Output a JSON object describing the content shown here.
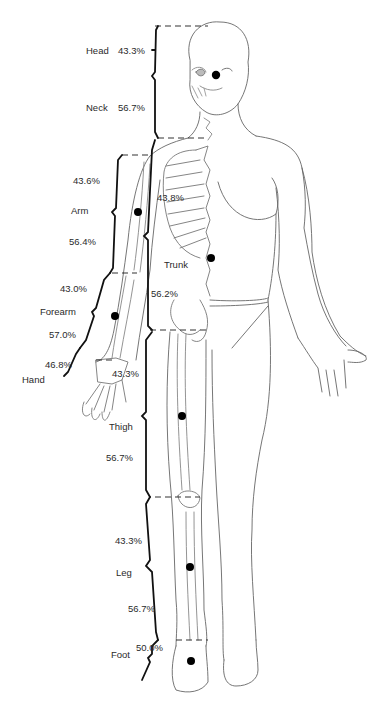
{
  "diagram": {
    "segments": [
      {
        "name": "Head",
        "proximal_pct": "43.3%"
      },
      {
        "name": "Neck",
        "distal_pct": "56.7%"
      },
      {
        "name": "Arm",
        "proximal_pct": "43.6%",
        "distal_pct": "56.4%"
      },
      {
        "name": "Forearm",
        "proximal_pct": "43.0%",
        "distal_pct": "57.0%"
      },
      {
        "name": "Hand",
        "proximal_pct": "46.8%"
      },
      {
        "name": "Trunk",
        "proximal_pct": "43.8%",
        "distal_pct": "56.2%"
      },
      {
        "name": "Thigh",
        "proximal_pct": "43.3%",
        "distal_pct": "56.7%"
      },
      {
        "name": "Leg",
        "proximal_pct": "43.3%",
        "distal_pct": "56.7%"
      },
      {
        "name": "Foot",
        "proximal_pct": "50.0%"
      }
    ]
  },
  "labels": {
    "head": "Head",
    "head_pct": "43.3%",
    "neck": "Neck",
    "neck_pct": "56.7%",
    "arm": "Arm",
    "arm_top_pct": "43.6%",
    "arm_bottom_pct": "56.4%",
    "trunk": "Trunk",
    "trunk_top_pct": "43.8%",
    "trunk_bottom_pct": "56.2%",
    "forearm": "Forearm",
    "forearm_top_pct": "43.0%",
    "forearm_bottom_pct": "57.0%",
    "hand": "Hand",
    "hand_pct": "46.8%",
    "thigh": "Thigh",
    "thigh_top_pct": "43.3%",
    "thigh_bottom_pct": "56.7%",
    "leg": "Leg",
    "leg_top_pct": "43.3%",
    "leg_bottom_pct": "56.7%",
    "foot": "Foot",
    "foot_pct": "50.0%"
  },
  "colors": {
    "line": "#555555",
    "bracket": "#111111",
    "dot": "#000000"
  }
}
